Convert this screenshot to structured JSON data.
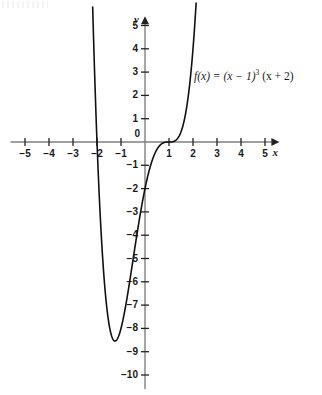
{
  "chart_data": {
    "type": "line",
    "title": "",
    "subtitle": "",
    "xlabel": "x",
    "ylabel": "y",
    "xlim": [
      -5.6,
      5.6
    ],
    "ylim": [
      -10.6,
      5.4
    ],
    "grid": false,
    "legend_position": "inside-upper-right",
    "annotations": [
      {
        "name": "function-equation",
        "text": "f(x) = (x − 1)³ (x + 2)",
        "x": 2.05,
        "y": 2.8
      }
    ],
    "axes": {
      "x_ticks": [
        -5,
        -4,
        -3,
        -2,
        -1,
        0,
        1,
        2,
        3,
        4,
        5
      ],
      "x_tick_labels": [
        "−5",
        "−4",
        "−3",
        "−2",
        "−1",
        "0",
        "1",
        "2",
        "3",
        "4",
        "5"
      ],
      "y_ticks": [
        -10,
        -9,
        -8,
        -7,
        -6,
        -5,
        -4,
        -3,
        -2,
        -1,
        1,
        2,
        3,
        4,
        5
      ],
      "y_tick_labels": [
        "−10",
        "−9",
        "−8",
        "−7",
        "−6",
        "−5",
        "−4",
        "−3",
        "−2",
        "−1",
        "1",
        "2",
        "3",
        "4",
        "5"
      ],
      "x_axis_label": "x",
      "y_axis_label": "y",
      "origin_label": "0",
      "arrow_x": true,
      "arrow_y": true,
      "axis_color": "#808080"
    },
    "series": [
      {
        "name": "f(x) = (x − 1)³ (x + 2)",
        "expression": "(x-1)^3*(x+2)",
        "color": "#111111",
        "line_width": 1.6,
        "roots": [
          -2,
          1
        ],
        "root_multiplicities": [
          1,
          3
        ],
        "local_minimum": {
          "x": -0.8,
          "y": -8.4
        },
        "inflection_flat_at": 1,
        "y_intercept": -2,
        "x": [
          -2.45,
          -2.4,
          -2.3,
          -2.2,
          -2.1,
          -2.0,
          -1.9,
          -1.8,
          -1.7,
          -1.6,
          -1.5,
          -1.4,
          -1.3,
          -1.2,
          -1.1,
          -1.0,
          -0.9,
          -0.8,
          -0.7,
          -0.6,
          -0.5,
          -0.4,
          -0.3,
          -0.2,
          -0.1,
          0.0,
          0.1,
          0.2,
          0.3,
          0.4,
          0.5,
          0.6,
          0.7,
          0.8,
          0.9,
          1.0,
          1.1,
          1.2,
          1.3,
          1.4,
          1.5,
          1.6,
          1.7,
          1.8,
          1.9,
          2.0,
          2.05
        ],
        "y": [
          18.5,
          14.9,
          8.6,
          3.6,
          -0.3,
          -3.0,
          -4.9,
          -6.2,
          -7.1,
          -7.7,
          -8.0,
          -8.2,
          -8.3,
          -8.4,
          -8.4,
          -8.4,
          -8.3,
          -8.0,
          -7.6,
          -7.2,
          -6.6,
          -6.0,
          -5.3,
          -4.5,
          -3.7,
          -2.0,
          -2.0,
          -1.4,
          -0.9,
          -0.5,
          -0.2,
          -0.1,
          -0.02,
          0.0,
          0.0,
          0.0,
          0.03,
          0.3,
          1.0,
          2.5,
          4.4,
          7.6,
          12.1,
          18.6,
          27.4,
          38.9,
          45.0
        ]
      }
    ]
  },
  "plot": {
    "origin_px": {
      "x": 145,
      "y": 142
    },
    "scale_px": {
      "x": 24,
      "y": 23.3
    },
    "function_label_html": "f(x) = (x − 1)",
    "function_label_exponent": "3",
    "function_label_tail": " (x + 2)"
  }
}
